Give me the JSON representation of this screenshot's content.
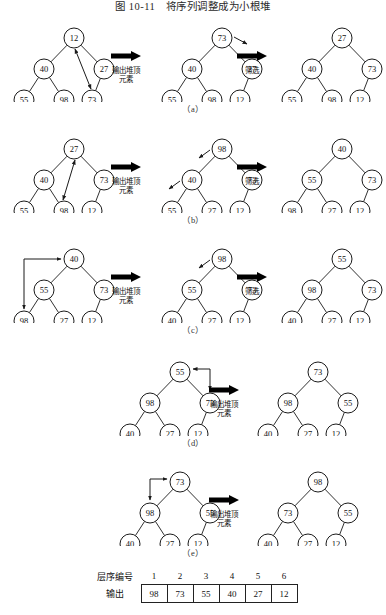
{
  "figure": {
    "title": "图 10-11　将序列调整成为小根堆",
    "arrow_label_output": "输出堆顶\n元素",
    "arrow_label_output_line1": "输出堆顶",
    "arrow_label_output_line2": "元素",
    "arrow_label_sift": "筛选",
    "section_labels": [
      "（a）",
      "（b）",
      "（c）",
      "（d）",
      "（e）"
    ]
  },
  "colors": {
    "ink": "#111111",
    "node_stroke": "#1a1a1a",
    "node_fill": "#ffffff",
    "arrow_fill": "#000000",
    "background": "#ffffff"
  },
  "rows": [
    {
      "id": "a",
      "label": "（a）",
      "trees": [
        {
          "name": "tree-a-1",
          "nodes": [
            {
              "id": "n0",
              "value": "12",
              "x": 60,
              "y": 14
            },
            {
              "id": "n1",
              "value": "40",
              "x": 30,
              "y": 45
            },
            {
              "id": "n2",
              "value": "27",
              "x": 90,
              "y": 45
            },
            {
              "id": "n3",
              "value": "55",
              "x": 10,
              "y": 76
            },
            {
              "id": "n4",
              "value": "98",
              "x": 50,
              "y": 76
            },
            {
              "id": "n5",
              "value": "73",
              "x": 78,
              "y": 76
            }
          ],
          "edges": [
            [
              "n0",
              "n1"
            ],
            [
              "n0",
              "n2"
            ],
            [
              "n1",
              "n3"
            ],
            [
              "n1",
              "n4"
            ],
            [
              "n2",
              "n5"
            ]
          ],
          "swap_arrows": [
            {
              "from": "n5",
              "to": "n0",
              "kind": "double"
            }
          ]
        },
        {
          "name": "tree-a-2",
          "nodes": [
            {
              "id": "n0",
              "value": "73",
              "x": 60,
              "y": 14
            },
            {
              "id": "n1",
              "value": "40",
              "x": 30,
              "y": 45
            },
            {
              "id": "n2",
              "value": "27",
              "x": 90,
              "y": 45
            },
            {
              "id": "n3",
              "value": "55",
              "x": 10,
              "y": 76
            },
            {
              "id": "n4",
              "value": "98",
              "x": 50,
              "y": 76
            },
            {
              "id": "n5",
              "value": "12",
              "x": 78,
              "y": 76
            }
          ],
          "edges": [
            [
              "n0",
              "n1"
            ],
            [
              "n0",
              "n2"
            ],
            [
              "n1",
              "n3"
            ],
            [
              "n1",
              "n4"
            ],
            [
              "n2",
              "n5"
            ]
          ],
          "hint_arrows": [
            {
              "from": "n0",
              "dir": "right-down"
            }
          ]
        },
        {
          "name": "tree-a-3",
          "nodes": [
            {
              "id": "n0",
              "value": "27",
              "x": 60,
              "y": 14
            },
            {
              "id": "n1",
              "value": "40",
              "x": 30,
              "y": 45
            },
            {
              "id": "n2",
              "value": "73",
              "x": 90,
              "y": 45
            },
            {
              "id": "n3",
              "value": "55",
              "x": 10,
              "y": 76
            },
            {
              "id": "n4",
              "value": "98",
              "x": 50,
              "y": 76
            },
            {
              "id": "n5",
              "value": "12",
              "x": 78,
              "y": 76
            }
          ],
          "edges": [
            [
              "n0",
              "n1"
            ],
            [
              "n0",
              "n2"
            ],
            [
              "n1",
              "n3"
            ],
            [
              "n1",
              "n4"
            ],
            [
              "n2",
              "n5"
            ]
          ]
        }
      ],
      "arrows": [
        "输出堆顶 元素",
        "筛选"
      ]
    },
    {
      "id": "b",
      "label": "（b）",
      "trees": [
        {
          "name": "tree-b-1",
          "nodes": [
            {
              "id": "n0",
              "value": "27",
              "x": 60,
              "y": 14
            },
            {
              "id": "n1",
              "value": "40",
              "x": 30,
              "y": 45
            },
            {
              "id": "n2",
              "value": "73",
              "x": 90,
              "y": 45
            },
            {
              "id": "n3",
              "value": "55",
              "x": 10,
              "y": 76
            },
            {
              "id": "n4",
              "value": "98",
              "x": 50,
              "y": 76
            },
            {
              "id": "n5",
              "value": "12",
              "x": 78,
              "y": 76
            }
          ],
          "edges": [
            [
              "n0",
              "n1"
            ],
            [
              "n0",
              "n2"
            ],
            [
              "n1",
              "n3"
            ],
            [
              "n1",
              "n4"
            ],
            [
              "n2",
              "n5"
            ]
          ],
          "swap_arrows": [
            {
              "from": "n4",
              "to": "n0",
              "kind": "double"
            }
          ]
        },
        {
          "name": "tree-b-2",
          "nodes": [
            {
              "id": "n0",
              "value": "98",
              "x": 60,
              "y": 14
            },
            {
              "id": "n1",
              "value": "40",
              "x": 30,
              "y": 45
            },
            {
              "id": "n2",
              "value": "73",
              "x": 90,
              "y": 45
            },
            {
              "id": "n3",
              "value": "55",
              "x": 10,
              "y": 76
            },
            {
              "id": "n4",
              "value": "27",
              "x": 50,
              "y": 76
            },
            {
              "id": "n5",
              "value": "12",
              "x": 78,
              "y": 76
            }
          ],
          "edges": [
            [
              "n0",
              "n1"
            ],
            [
              "n0",
              "n2"
            ],
            [
              "n1",
              "n3"
            ],
            [
              "n1",
              "n4"
            ],
            [
              "n2",
              "n5"
            ]
          ],
          "hint_arrows": [
            {
              "from": "n0",
              "dir": "left-down"
            },
            {
              "from": "n1",
              "dir": "left-down"
            }
          ]
        },
        {
          "name": "tree-b-3",
          "nodes": [
            {
              "id": "n0",
              "value": "40",
              "x": 60,
              "y": 14
            },
            {
              "id": "n1",
              "value": "55",
              "x": 30,
              "y": 45
            },
            {
              "id": "n2",
              "value": "73",
              "x": 90,
              "y": 45
            },
            {
              "id": "n3",
              "value": "98",
              "x": 10,
              "y": 76
            },
            {
              "id": "n4",
              "value": "27",
              "x": 50,
              "y": 76
            },
            {
              "id": "n5",
              "value": "12",
              "x": 78,
              "y": 76
            }
          ],
          "edges": [
            [
              "n0",
              "n1"
            ],
            [
              "n0",
              "n2"
            ],
            [
              "n1",
              "n3"
            ],
            [
              "n1",
              "n4"
            ],
            [
              "n2",
              "n5"
            ]
          ]
        }
      ],
      "arrows": [
        "输出堆顶 元素",
        "筛选"
      ]
    },
    {
      "id": "c",
      "label": "（c）",
      "trees": [
        {
          "name": "tree-c-1",
          "nodes": [
            {
              "id": "n0",
              "value": "40",
              "x": 60,
              "y": 14
            },
            {
              "id": "n1",
              "value": "55",
              "x": 30,
              "y": 45
            },
            {
              "id": "n2",
              "value": "73",
              "x": 90,
              "y": 45
            },
            {
              "id": "n3",
              "value": "98",
              "x": 10,
              "y": 76
            },
            {
              "id": "n4",
              "value": "27",
              "x": 50,
              "y": 76
            },
            {
              "id": "n5",
              "value": "12",
              "x": 78,
              "y": 76
            }
          ],
          "edges": [
            [
              "n0",
              "n1"
            ],
            [
              "n0",
              "n2"
            ],
            [
              "n1",
              "n3"
            ],
            [
              "n1",
              "n4"
            ],
            [
              "n2",
              "n5"
            ]
          ],
          "swap_arrows": [
            {
              "from": "n3",
              "to": "n0",
              "kind": "double-outer-left"
            }
          ]
        },
        {
          "name": "tree-c-2",
          "nodes": [
            {
              "id": "n0",
              "value": "98",
              "x": 60,
              "y": 14
            },
            {
              "id": "n1",
              "value": "55",
              "x": 30,
              "y": 45
            },
            {
              "id": "n2",
              "value": "73",
              "x": 90,
              "y": 45
            },
            {
              "id": "n3",
              "value": "40",
              "x": 10,
              "y": 76
            },
            {
              "id": "n4",
              "value": "27",
              "x": 50,
              "y": 76
            },
            {
              "id": "n5",
              "value": "12",
              "x": 78,
              "y": 76
            }
          ],
          "edges": [
            [
              "n0",
              "n1"
            ],
            [
              "n0",
              "n2"
            ],
            [
              "n1",
              "n3"
            ],
            [
              "n1",
              "n4"
            ],
            [
              "n2",
              "n5"
            ]
          ],
          "hint_arrows": [
            {
              "from": "n0",
              "dir": "left-down"
            }
          ]
        },
        {
          "name": "tree-c-3",
          "nodes": [
            {
              "id": "n0",
              "value": "55",
              "x": 60,
              "y": 14
            },
            {
              "id": "n1",
              "value": "98",
              "x": 30,
              "y": 45
            },
            {
              "id": "n2",
              "value": "73",
              "x": 90,
              "y": 45
            },
            {
              "id": "n3",
              "value": "40",
              "x": 10,
              "y": 76
            },
            {
              "id": "n4",
              "value": "27",
              "x": 50,
              "y": 76
            },
            {
              "id": "n5",
              "value": "12",
              "x": 78,
              "y": 76
            }
          ],
          "edges": [
            [
              "n0",
              "n1"
            ],
            [
              "n0",
              "n2"
            ],
            [
              "n1",
              "n3"
            ],
            [
              "n1",
              "n4"
            ],
            [
              "n2",
              "n5"
            ]
          ]
        }
      ],
      "arrows": [
        "输出堆顶 元素",
        "筛选"
      ]
    },
    {
      "id": "d",
      "label": "（d）",
      "trees": [
        {
          "name": "tree-d-1",
          "nodes": [
            {
              "id": "n0",
              "value": "55",
              "x": 60,
              "y": 14
            },
            {
              "id": "n1",
              "value": "98",
              "x": 30,
              "y": 45
            },
            {
              "id": "n2",
              "value": "73",
              "x": 90,
              "y": 45
            },
            {
              "id": "n3",
              "value": "40",
              "x": 10,
              "y": 76
            },
            {
              "id": "n4",
              "value": "27",
              "x": 50,
              "y": 76
            },
            {
              "id": "n5",
              "value": "12",
              "x": 78,
              "y": 76
            }
          ],
          "edges": [
            [
              "n0",
              "n1"
            ],
            [
              "n0",
              "n2"
            ],
            [
              "n1",
              "n3"
            ],
            [
              "n1",
              "n4"
            ],
            [
              "n2",
              "n5"
            ]
          ],
          "swap_arrows": [
            {
              "from": "n2",
              "to": "n0",
              "kind": "double-top-right"
            }
          ]
        },
        {
          "name": "tree-d-2",
          "nodes": [
            {
              "id": "n0",
              "value": "73",
              "x": 60,
              "y": 14
            },
            {
              "id": "n1",
              "value": "98",
              "x": 30,
              "y": 45
            },
            {
              "id": "n2",
              "value": "55",
              "x": 90,
              "y": 45
            },
            {
              "id": "n3",
              "value": "40",
              "x": 10,
              "y": 76
            },
            {
              "id": "n4",
              "value": "27",
              "x": 50,
              "y": 76
            },
            {
              "id": "n5",
              "value": "12",
              "x": 78,
              "y": 76
            }
          ],
          "edges": [
            [
              "n0",
              "n1"
            ],
            [
              "n0",
              "n2"
            ],
            [
              "n1",
              "n3"
            ],
            [
              "n1",
              "n4"
            ],
            [
              "n2",
              "n5"
            ]
          ]
        }
      ],
      "arrows": [
        "输出堆顶 元素"
      ]
    },
    {
      "id": "e",
      "label": "（e）",
      "trees": [
        {
          "name": "tree-e-1",
          "nodes": [
            {
              "id": "n0",
              "value": "73",
              "x": 60,
              "y": 14
            },
            {
              "id": "n1",
              "value": "98",
              "x": 30,
              "y": 45
            },
            {
              "id": "n2",
              "value": "55",
              "x": 90,
              "y": 45
            },
            {
              "id": "n3",
              "value": "40",
              "x": 10,
              "y": 76
            },
            {
              "id": "n4",
              "value": "27",
              "x": 50,
              "y": 76
            },
            {
              "id": "n5",
              "value": "12",
              "x": 78,
              "y": 76
            }
          ],
          "edges": [
            [
              "n0",
              "n1"
            ],
            [
              "n0",
              "n2"
            ],
            [
              "n1",
              "n3"
            ],
            [
              "n1",
              "n4"
            ],
            [
              "n2",
              "n5"
            ]
          ],
          "swap_arrows": [
            {
              "from": "n1",
              "to": "n0",
              "kind": "double-top-left"
            }
          ]
        },
        {
          "name": "tree-e-2",
          "nodes": [
            {
              "id": "n0",
              "value": "98",
              "x": 60,
              "y": 14
            },
            {
              "id": "n1",
              "value": "73",
              "x": 30,
              "y": 45
            },
            {
              "id": "n2",
              "value": "55",
              "x": 90,
              "y": 45
            },
            {
              "id": "n3",
              "value": "40",
              "x": 10,
              "y": 76
            },
            {
              "id": "n4",
              "value": "27",
              "x": 50,
              "y": 76
            },
            {
              "id": "n5",
              "value": "12",
              "x": 78,
              "y": 76
            }
          ],
          "edges": [
            [
              "n0",
              "n1"
            ],
            [
              "n0",
              "n2"
            ],
            [
              "n1",
              "n3"
            ],
            [
              "n1",
              "n4"
            ],
            [
              "n2",
              "n5"
            ]
          ]
        }
      ],
      "arrows": [
        "输出堆顶 元素"
      ]
    }
  ],
  "table": {
    "row_headers": [
      "层序编号",
      "输出"
    ],
    "indices": [
      "1",
      "2",
      "3",
      "4",
      "5",
      "6"
    ],
    "outputs": [
      "98",
      "73",
      "55",
      "40",
      "27",
      "12"
    ]
  }
}
